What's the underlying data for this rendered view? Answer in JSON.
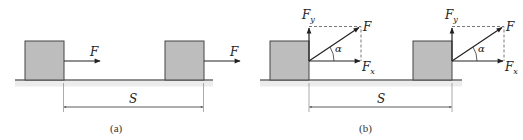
{
  "colors": {
    "block_fill": "#bdbdbd",
    "block_stroke": "#444444",
    "line": "#222222",
    "ground_shade": "#ececec",
    "dashed": "#555555"
  },
  "panel_a": {
    "caption": "(a)",
    "force_label_1": "F",
    "force_label_2": "F",
    "distance_label": "S"
  },
  "panel_b": {
    "caption": "(b)",
    "distance_label": "S",
    "left": {
      "force_label": "F",
      "fy_main": "F",
      "fy_sub": "y",
      "fx_main": "F",
      "fx_sub": "x",
      "angle_label": "α"
    },
    "right": {
      "force_label": "F",
      "fy_main": "F",
      "fy_sub": "y",
      "fx_main": "F",
      "fx_sub": "x",
      "angle_label": "α"
    }
  }
}
